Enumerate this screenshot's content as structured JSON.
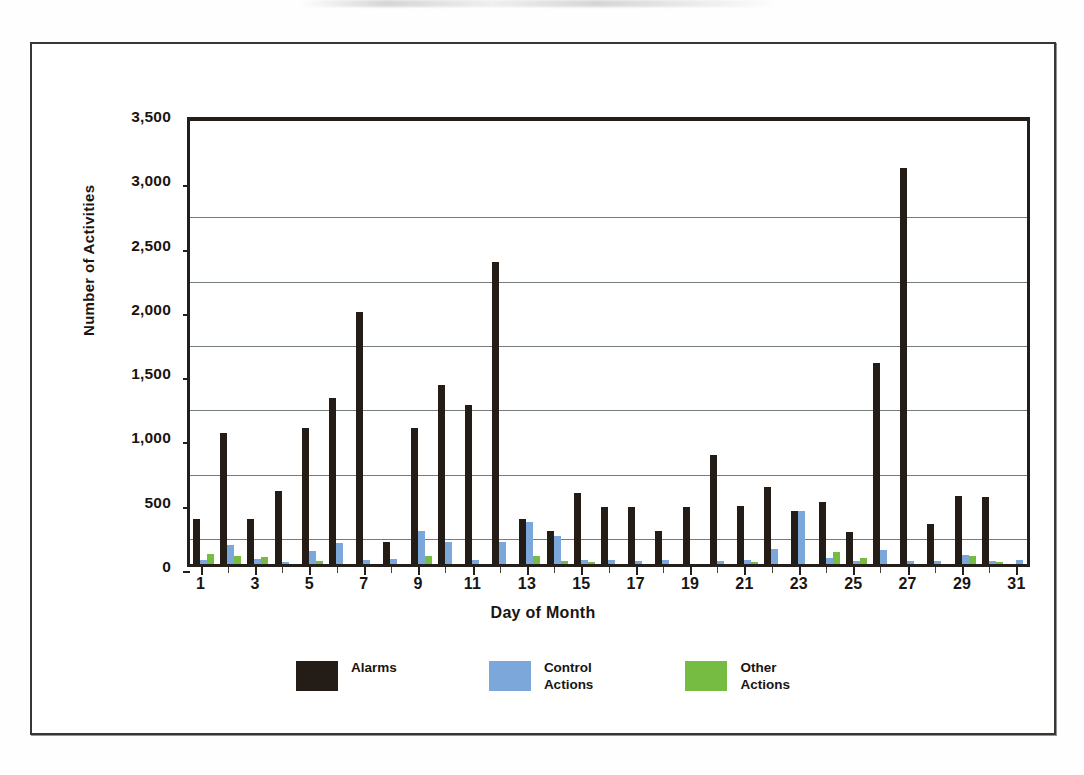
{
  "figure": {
    "y_axis_title": "Number of Activities",
    "x_axis_title": "Day of Month"
  },
  "legend": {
    "items": [
      {
        "label": "Alarms",
        "color": "#241c17"
      },
      {
        "label": "Control\nActions",
        "color": "#7ba7db"
      },
      {
        "label": "Other\nActions",
        "color": "#76bc43"
      }
    ]
  },
  "chart_data": {
    "type": "bar",
    "title": "",
    "xlabel": "Day of Month",
    "ylabel": "Number of Activities",
    "ylim": [
      0,
      3500
    ],
    "ytick_labels": [
      "3,500",
      "3,000",
      "2,500",
      "2,000",
      "1,500",
      "1,000",
      "500",
      "0"
    ],
    "ytick_values": [
      3500,
      3000,
      2500,
      2000,
      1500,
      1000,
      500,
      0
    ],
    "ytick_interval": 500,
    "gridlines": [
      2750,
      2250,
      1750,
      1250,
      750,
      250
    ],
    "grid": true,
    "legend_position": "bottom-center",
    "categories": [
      1,
      2,
      3,
      4,
      5,
      6,
      7,
      8,
      9,
      10,
      11,
      12,
      13,
      14,
      15,
      16,
      17,
      18,
      19,
      20,
      21,
      22,
      23,
      24,
      25,
      26,
      27,
      28,
      29,
      30,
      31
    ],
    "xtick_labels": [
      "1",
      "3",
      "5",
      "7",
      "9",
      "11",
      "13",
      "15",
      "17",
      "19",
      "21",
      "23",
      "25",
      "27",
      "29",
      "31"
    ],
    "series": [
      {
        "name": "Alarms",
        "color": "#241c17",
        "values": [
          350,
          1020,
          350,
          570,
          1060,
          1290,
          1960,
          170,
          1060,
          1390,
          1240,
          2350,
          350,
          260,
          550,
          440,
          440,
          260,
          440,
          850,
          450,
          600,
          410,
          480,
          250,
          1560,
          3080,
          310,
          530,
          520,
          0
        ]
      },
      {
        "name": "Control Actions",
        "color": "#7ba7db",
        "values": [
          30,
          150,
          40,
          10,
          100,
          160,
          30,
          40,
          255,
          170,
          30,
          170,
          330,
          215,
          30,
          30,
          20,
          30,
          0,
          20,
          30,
          120,
          410,
          50,
          20,
          110,
          25,
          20,
          70,
          25,
          30
        ]
      },
      {
        "name": "Other Actions",
        "color": "#76bc43",
        "values": [
          75,
          60,
          55,
          0,
          20,
          0,
          0,
          0,
          60,
          0,
          0,
          0,
          60,
          20,
          10,
          0,
          0,
          0,
          0,
          0,
          10,
          0,
          0,
          90,
          45,
          0,
          0,
          0,
          60,
          10,
          0
        ]
      }
    ]
  }
}
